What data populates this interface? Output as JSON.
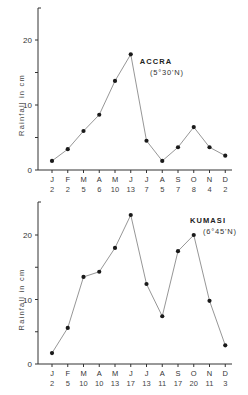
{
  "chart_data": [
    {
      "type": "line",
      "title": "ACCRA",
      "subtitle": "(5°30'N)",
      "xlabel": "",
      "ylabel": "Rainfall in cm",
      "ylim": [
        0,
        25
      ],
      "yticks": [
        0,
        5,
        10,
        15,
        20
      ],
      "ytick_labels": [
        "0",
        "",
        "10",
        "",
        "20"
      ],
      "grid": false,
      "categories": [
        "J",
        "F",
        "M",
        "A",
        "M",
        "J",
        "J",
        "A",
        "S",
        "O",
        "N",
        "D"
      ],
      "category_sublabels": [
        "2",
        "2",
        "5",
        "6",
        "10",
        "13",
        "7",
        "5",
        "7",
        "8",
        "4",
        "2"
      ],
      "series": [
        {
          "name": "Rainfall",
          "values": [
            1.4,
            3.2,
            6.0,
            8.5,
            13.7,
            17.8,
            4.5,
            1.4,
            3.5,
            6.6,
            3.5,
            2.2
          ]
        }
      ]
    },
    {
      "type": "line",
      "title": "KUMASI",
      "subtitle": "(6°45'N)",
      "xlabel": "",
      "ylabel": "Rainfall in cm",
      "ylim": [
        0,
        25
      ],
      "yticks": [
        0,
        5,
        10,
        15,
        20
      ],
      "ytick_labels": [
        "0",
        "",
        "10",
        "",
        "20"
      ],
      "grid": false,
      "categories": [
        "J",
        "F",
        "M",
        "A",
        "M",
        "J",
        "J",
        "A",
        "S",
        "O",
        "N",
        "D"
      ],
      "category_sublabels": [
        "2",
        "5",
        "10",
        "10",
        "13",
        "17",
        "13",
        "11",
        "17",
        "20",
        "11",
        "3"
      ],
      "series": [
        {
          "name": "Rainfall",
          "values": [
            1.7,
            5.6,
            13.5,
            14.3,
            18.0,
            23.1,
            12.4,
            7.4,
            17.5,
            20.0,
            9.8,
            2.9
          ]
        }
      ]
    }
  ]
}
